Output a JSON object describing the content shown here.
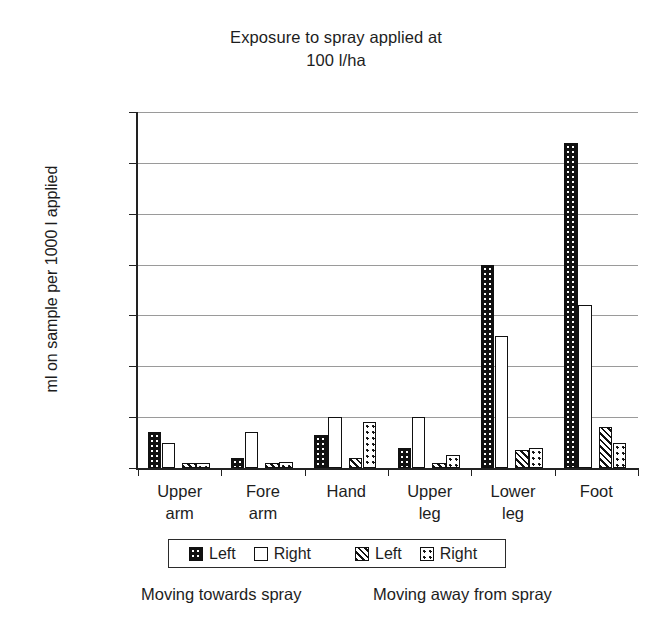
{
  "chart_data": {
    "type": "bar",
    "title": "Exposure to spray applied at 100 l/ha",
    "title_lines": [
      "Exposure to spray applied at",
      "100 l/ha"
    ],
    "xlabel": "",
    "ylabel": "ml on sample per 1000 l applied",
    "ylim": [
      0,
      70
    ],
    "ytick_step": 10,
    "yticks": [
      0,
      10,
      20,
      30,
      40,
      50,
      60,
      70
    ],
    "ytick_labels": [
      "0",
      "10",
      "20",
      "30",
      "40",
      "50",
      "60",
      "70"
    ],
    "grid": true,
    "grid_axis": "y",
    "legend_position": "bottom",
    "categories": [
      "Upper arm",
      "Fore arm",
      "Hand",
      "Upper leg",
      "Lower leg",
      "Foot"
    ],
    "category_lines": [
      [
        "Upper",
        "arm"
      ],
      [
        "Fore",
        "arm"
      ],
      [
        "Hand",
        ""
      ],
      [
        "Upper",
        "leg"
      ],
      [
        "Lower",
        "leg"
      ],
      [
        "Foot",
        ""
      ]
    ],
    "series": [
      {
        "name": "Left",
        "group": "Moving towards spray",
        "pattern": "dark-dotted",
        "color": "#111111",
        "values": [
          7,
          2,
          6.5,
          4,
          40,
          64
        ]
      },
      {
        "name": "Right",
        "group": "Moving towards spray",
        "pattern": "white",
        "color": "#ffffff",
        "values": [
          5,
          7,
          10,
          10,
          26,
          32
        ]
      },
      {
        "name": "Left",
        "group": "Moving away from spray",
        "pattern": "hatched",
        "color": "#ffffff",
        "values": [
          1,
          1,
          2,
          1,
          3.5,
          8
        ]
      },
      {
        "name": "Right",
        "group": "Moving away from spray",
        "pattern": "light-dotted",
        "color": "#ffffff",
        "values": [
          1,
          1.2,
          9,
          2.5,
          4,
          5
        ]
      }
    ],
    "annotations": {
      "caption_left": "Moving towards spray",
      "caption_right": "Moving away from spray"
    }
  },
  "legend": {
    "items": [
      {
        "label": "Left",
        "pattern": "dark-dotted"
      },
      {
        "label": "Right",
        "pattern": "white"
      },
      {
        "label": "Left",
        "pattern": "hatched"
      },
      {
        "label": "Right",
        "pattern": "light-dotted"
      }
    ]
  },
  "colors": {
    "ink": "#111111",
    "grid": "#9a9a9a",
    "background": "#ffffff"
  }
}
